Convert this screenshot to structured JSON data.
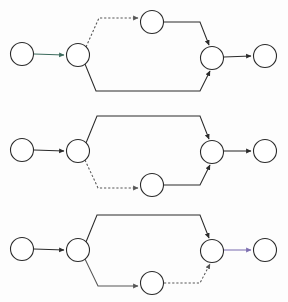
{
  "canvas": {
    "width": 288,
    "height": 302,
    "background": "#fdfdfd",
    "title": "Three-row parallel branch graph diagram"
  },
  "style": {
    "node_fill": "#ffffff",
    "node_stroke": "#2b2b2b",
    "node_radius": 11.5,
    "edge_black": "#2b2b2b",
    "edge_gray": "#565656",
    "edge_teal": "#3c6b5d",
    "edge_purple": "#7d6fb0",
    "stroke_width": 1.05,
    "dash_pattern": "2.2 1.9"
  },
  "rows": [
    {
      "id": "row-1",
      "label": "Row 1",
      "dashed_branch": "top",
      "nodes": [
        {
          "id": "r1-n1",
          "name": "source",
          "cx": 22,
          "cy": 54
        },
        {
          "id": "r1-n2",
          "name": "split",
          "cx": 78,
          "cy": 55
        },
        {
          "id": "r1-n3",
          "name": "top-branch",
          "cx": 152,
          "cy": 22
        },
        {
          "id": "r1-n4",
          "name": "merge",
          "cx": 212,
          "cy": 58
        },
        {
          "id": "r1-n5",
          "name": "sink",
          "cx": 265,
          "cy": 56
        }
      ],
      "edges": [
        {
          "id": "r1-e1",
          "name": "source-to-split",
          "from": "r1-n1",
          "to": "r1-n2",
          "style": "solid",
          "color": "#3c6b5d",
          "arrow": true,
          "path": "M 34 54 L 64 55"
        },
        {
          "id": "r1-e2",
          "name": "split-to-top-branch",
          "from": "r1-n2",
          "to": "r1-n3",
          "style": "dashed",
          "color": "#565656",
          "arrow": true,
          "path": "M 86 47 L 99 18 L 138 18"
        },
        {
          "id": "r1-e3",
          "name": "top-branch-to-merge",
          "from": "r1-n3",
          "to": "r1-n4",
          "style": "solid",
          "color": "#2b2b2b",
          "arrow": true,
          "path": "M 164 22 L 200 22 L 209 45"
        },
        {
          "id": "r1-e4",
          "name": "split-to-bottom-path",
          "from": "r1-n2",
          "to": "r1-n4",
          "style": "solid",
          "color": "#2b2b2b",
          "arrow": true,
          "path": "M 85 64 L 96 91 L 200 91 L 210 71"
        },
        {
          "id": "r1-e5",
          "name": "merge-to-sink",
          "from": "r1-n4",
          "to": "r1-n5",
          "style": "solid",
          "color": "#2b2b2b",
          "arrow": true,
          "path": "M 224 57 L 251 56"
        }
      ]
    },
    {
      "id": "row-2",
      "label": "Row 2",
      "dashed_branch": "bottom",
      "nodes": [
        {
          "id": "r2-n1",
          "name": "source",
          "cx": 22,
          "cy": 150
        },
        {
          "id": "r2-n2",
          "name": "split",
          "cx": 78,
          "cy": 151
        },
        {
          "id": "r2-n3",
          "name": "bottom-branch",
          "cx": 152,
          "cy": 185
        },
        {
          "id": "r2-n4",
          "name": "merge",
          "cx": 212,
          "cy": 152
        },
        {
          "id": "r2-n5",
          "name": "sink",
          "cx": 265,
          "cy": 151
        }
      ],
      "edges": [
        {
          "id": "r2-e1",
          "name": "source-to-split",
          "from": "r2-n1",
          "to": "r2-n2",
          "style": "solid",
          "color": "#2b2b2b",
          "arrow": true,
          "path": "M 34 150 L 64 151"
        },
        {
          "id": "r2-e2",
          "name": "split-to-top-path",
          "from": "r2-n2",
          "to": "r2-n4",
          "style": "solid",
          "color": "#2b2b2b",
          "arrow": true,
          "path": "M 86 143 L 97 116 L 200 116 L 209 139"
        },
        {
          "id": "r2-e3",
          "name": "split-to-bottom-branch",
          "from": "r2-n2",
          "to": "r2-n3",
          "style": "dashed",
          "color": "#565656",
          "arrow": true,
          "path": "M 85 160 L 98 188 L 138 188"
        },
        {
          "id": "r2-e4",
          "name": "bottom-branch-to-merge",
          "from": "r2-n3",
          "to": "r2-n4",
          "style": "solid",
          "color": "#2b2b2b",
          "arrow": true,
          "path": "M 164 185 L 200 185 L 210 165"
        },
        {
          "id": "r2-e5",
          "name": "merge-to-sink",
          "from": "r2-n4",
          "to": "r2-n5",
          "style": "solid",
          "color": "#2b2b2b",
          "arrow": true,
          "path": "M 224 151 L 251 151"
        }
      ]
    },
    {
      "id": "row-3",
      "label": "Row 3",
      "dashed_branch": "bottom-out",
      "nodes": [
        {
          "id": "r3-n1",
          "name": "source",
          "cx": 22,
          "cy": 249
        },
        {
          "id": "r3-n2",
          "name": "split",
          "cx": 78,
          "cy": 250
        },
        {
          "id": "r3-n3",
          "name": "bottom-branch",
          "cx": 152,
          "cy": 283
        },
        {
          "id": "r3-n4",
          "name": "merge",
          "cx": 212,
          "cy": 251
        },
        {
          "id": "r3-n5",
          "name": "sink",
          "cx": 265,
          "cy": 250
        }
      ],
      "edges": [
        {
          "id": "r3-e1",
          "name": "source-to-split",
          "from": "r3-n1",
          "to": "r3-n2",
          "style": "solid",
          "color": "#2b2b2b",
          "arrow": true,
          "path": "M 34 249 L 64 250"
        },
        {
          "id": "r3-e2",
          "name": "split-to-top-path",
          "from": "r3-n2",
          "to": "r3-n4",
          "style": "solid",
          "color": "#2b2b2b",
          "arrow": true,
          "path": "M 86 242 L 97 215 L 200 215 L 209 238"
        },
        {
          "id": "r3-e3",
          "name": "split-to-bottom-branch",
          "from": "r3-n2",
          "to": "r3-n3",
          "style": "solid",
          "color": "#565656",
          "arrow": true,
          "path": "M 85 259 L 98 286 L 138 286"
        },
        {
          "id": "r3-e4",
          "name": "bottom-branch-to-merge",
          "from": "r3-n3",
          "to": "r3-n4",
          "style": "dashed",
          "color": "#565656",
          "arrow": true,
          "path": "M 164 283 L 200 283 L 210 264"
        },
        {
          "id": "r3-e5",
          "name": "merge-to-sink",
          "from": "r3-n4",
          "to": "r3-n5",
          "style": "solid",
          "color": "#7d6fb0",
          "arrow": true,
          "path": "M 224 250 L 251 250"
        }
      ]
    }
  ]
}
